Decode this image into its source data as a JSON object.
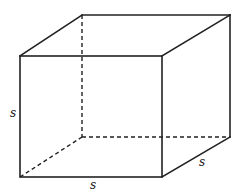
{
  "diagram": {
    "colors": {
      "stroke": "#222222",
      "background": "#ffffff"
    },
    "vertices": {
      "front_top_left": [
        20,
        56
      ],
      "front_top_right": [
        162,
        56
      ],
      "front_bottom_left": [
        20,
        177
      ],
      "front_bottom_right": [
        162,
        177
      ],
      "back_top_left": [
        82,
        15
      ],
      "back_top_right": [
        230,
        15
      ],
      "back_bottom_left": [
        82,
        137
      ],
      "back_bottom_right": [
        230,
        137
      ]
    },
    "labels": {
      "left": {
        "text": "s",
        "x": 10,
        "y": 117
      },
      "bottom": {
        "text": "s",
        "x": 90,
        "y": 189
      },
      "right": {
        "text": "s",
        "x": 199,
        "y": 166
      }
    }
  }
}
